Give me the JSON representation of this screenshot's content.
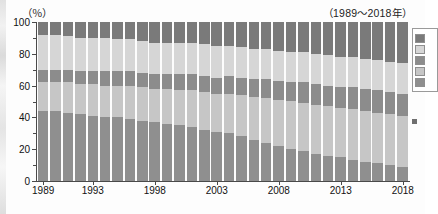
{
  "chart_data": {
    "type": "bar",
    "stacked": true,
    "percent_stacked": true,
    "title": "",
    "subtitle": "（1989～2018年）",
    "unit_label": "（％）",
    "xlabel": "",
    "ylabel": "",
    "ylim": [
      0,
      100
    ],
    "yticks": [
      0,
      20,
      40,
      60,
      80,
      100
    ],
    "ytick_labels": [
      "0",
      "20",
      "40",
      "60",
      "80",
      "100"
    ],
    "grid": false,
    "legend_position": "right",
    "categories": [
      "1989",
      "1990",
      "1991",
      "1992",
      "1993",
      "1994",
      "1995",
      "1996",
      "1997",
      "1998",
      "1999",
      "2000",
      "2001",
      "2002",
      "2003",
      "2004",
      "2005",
      "2006",
      "2007",
      "2008",
      "2009",
      "2010",
      "2011",
      "2012",
      "2013",
      "2014",
      "2015",
      "2016",
      "2017",
      "2018"
    ],
    "xtick_labels": [
      "1989",
      "1993",
      "1998",
      "2003",
      "2008",
      "2013",
      "2018"
    ],
    "xtick_categories": [
      "1989",
      "1993",
      "1998",
      "2003",
      "2008",
      "2013",
      "2018"
    ],
    "series": [
      {
        "name": "series-1",
        "color": "#8f8f8f",
        "values": [
          44,
          44,
          43,
          42,
          41,
          40,
          40,
          39,
          38,
          37,
          36,
          35,
          34,
          32,
          31,
          30,
          28,
          26,
          24,
          22,
          20,
          19,
          17,
          16,
          15,
          13,
          12,
          11,
          10,
          9
        ]
      },
      {
        "name": "series-2",
        "color": "#c6c6c6",
        "values": [
          18,
          18,
          19,
          19,
          20,
          20,
          20,
          21,
          21,
          21,
          22,
          22,
          23,
          24,
          24,
          25,
          26,
          27,
          28,
          29,
          30,
          30,
          31,
          31,
          31,
          32,
          32,
          32,
          32,
          32
        ]
      },
      {
        "name": "series-3",
        "color": "#8c8c8c",
        "values": [
          8,
          8,
          8,
          8,
          8,
          9,
          9,
          9,
          9,
          9,
          9,
          10,
          10,
          10,
          10,
          11,
          11,
          11,
          12,
          12,
          12,
          13,
          13,
          13,
          13,
          14,
          14,
          14,
          14,
          14
        ]
      },
      {
        "name": "series-4",
        "color": "#d6d6d6",
        "values": [
          22,
          22,
          21,
          21,
          21,
          21,
          20,
          20,
          20,
          20,
          20,
          20,
          20,
          20,
          20,
          19,
          19,
          19,
          19,
          19,
          19,
          19,
          19,
          19,
          19,
          19,
          19,
          19,
          19,
          19
        ]
      },
      {
        "name": "series-5",
        "color": "#7a7a7a",
        "values": [
          8,
          8,
          9,
          10,
          10,
          10,
          11,
          11,
          12,
          13,
          13,
          13,
          13,
          14,
          15,
          15,
          16,
          17,
          17,
          18,
          19,
          19,
          20,
          21,
          22,
          22,
          23,
          24,
          25,
          26
        ]
      }
    ],
    "legend": [
      {
        "label": "",
        "color": "#7a7a7a"
      },
      {
        "label": "",
        "color": "#d6d6d6"
      },
      {
        "label": "",
        "color": "#8c8c8c"
      },
      {
        "label": "",
        "color": "#c6c6c6"
      },
      {
        "label": "",
        "color": "#8f8f8f"
      }
    ],
    "side_note": ""
  }
}
